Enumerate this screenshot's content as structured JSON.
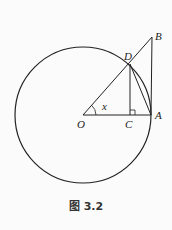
{
  "figure": {
    "caption": "图 3.2",
    "points": {
      "O": {
        "label": "O",
        "x": 83,
        "y": 115
      },
      "A": {
        "label": "A",
        "x": 151,
        "y": 115
      },
      "C": {
        "label": "C",
        "x": 130,
        "y": 115
      },
      "D": {
        "label": "D",
        "x": 130,
        "y": 64
      },
      "B": {
        "label": "B",
        "x": 152,
        "y": 37
      }
    },
    "angle_label": "x",
    "circle": {
      "cx": 83,
      "cy": 115,
      "r": 68
    },
    "stroke_color": "#222222"
  }
}
